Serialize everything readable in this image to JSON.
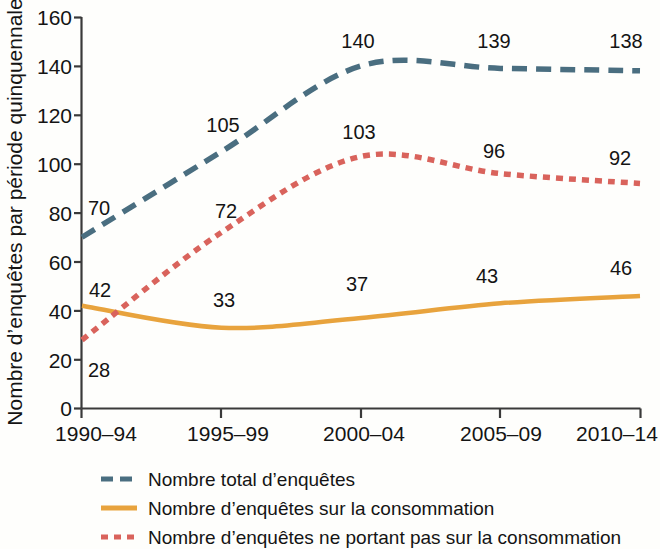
{
  "chart_data": {
    "type": "line",
    "title": "",
    "xlabel": "",
    "ylabel": "Nombre d’enquêtes par période quinquennale",
    "categories": [
      "1990–94",
      "1995–99",
      "2000–04",
      "2005–09",
      "2010–14"
    ],
    "ylim": [
      0,
      160
    ],
    "yticks": [
      0,
      20,
      40,
      60,
      80,
      100,
      120,
      140,
      160
    ],
    "ytick_labels": [
      "0",
      "20",
      "40",
      "60",
      "80",
      "100",
      "120",
      "140",
      "160"
    ],
    "grid": false,
    "legend_position": "bottom",
    "series": [
      {
        "name": "Nombre total d’enquêtes",
        "values": [
          70,
          105,
          140,
          139,
          138
        ],
        "labels": [
          "70",
          "105",
          "140",
          "139",
          "138"
        ],
        "color": "#4a6e80",
        "style": "long-dash"
      },
      {
        "name": "Nombre d’enquêtes sur la consommation",
        "values": [
          42,
          33,
          37,
          43,
          46
        ],
        "labels": [
          "42",
          "33",
          "37",
          "43",
          "46"
        ],
        "color": "#e8a33d",
        "style": "solid"
      },
      {
        "name": "Nombre d’enquêtes ne portant pas sur la consommation",
        "values": [
          28,
          72,
          103,
          96,
          92
        ],
        "labels": [
          "28",
          "72",
          "103",
          "96",
          "92"
        ],
        "color": "#d9635c",
        "style": "short-dash"
      }
    ]
  },
  "axis": {
    "y_title": "Nombre d’enquêtes par période quinquennale",
    "y_labels": {
      "t160": "160",
      "t140": "140",
      "t120": "120",
      "t100": "100",
      "t80": "80",
      "t60": "60",
      "t40": "40",
      "t20": "20",
      "t0": "0"
    },
    "x_labels": {
      "c0": "1990–94",
      "c1": "1995–99",
      "c2": "2000–04",
      "c3": "2005–09",
      "c4": "2010–14"
    }
  },
  "data_labels": {
    "total": {
      "p0": "70",
      "p1": "105",
      "p2": "140",
      "p3": "139",
      "p4": "138"
    },
    "consumption": {
      "p0": "42",
      "p1": "33",
      "p2": "37",
      "p3": "43",
      "p4": "46"
    },
    "non_consumption": {
      "p0": "28",
      "p1": "72",
      "p2": "103",
      "p3": "96",
      "p4": "92"
    }
  },
  "legend": {
    "items": [
      {
        "label": "Nombre total d’enquêtes",
        "color": "#4a6e80",
        "style": "long-dash"
      },
      {
        "label": "Nombre d’enquêtes sur la consommation",
        "color": "#e8a33d",
        "style": "solid"
      },
      {
        "label": "Nombre d’enquêtes ne portant pas sur la consommation",
        "color": "#d9635c",
        "style": "short-dash"
      }
    ]
  },
  "colors": {
    "background": "#fefefc",
    "axis": "#3a3a3a",
    "text": "#141414",
    "series_total": "#4a6e80",
    "series_consumption": "#e8a33d",
    "series_non_consumption": "#d9635c"
  }
}
